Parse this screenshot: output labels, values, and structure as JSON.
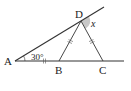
{
  "figure": {
    "points": {
      "A": {
        "label": "A",
        "x": 15,
        "y": 61
      },
      "B": {
        "label": "B",
        "x": 59,
        "y": 61
      },
      "C": {
        "label": "C",
        "x": 103,
        "y": 61
      },
      "D": {
        "label": "D",
        "x": 81,
        "y": 21
      }
    },
    "angle_at_A": "30°",
    "unknown_angle": "x",
    "colors": {
      "line": "#333333",
      "shade": "#c8c8c8"
    }
  }
}
